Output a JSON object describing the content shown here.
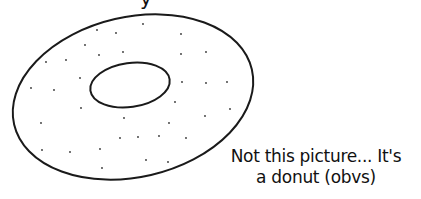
{
  "top_fragment": "y",
  "caption": {
    "line1": "Not this picture... It's",
    "line2": "a donut (obvs)"
  },
  "drawing": {
    "subject": "donut-outline",
    "stroke_color": "#1a1a1a",
    "dot_color": "#333333"
  }
}
